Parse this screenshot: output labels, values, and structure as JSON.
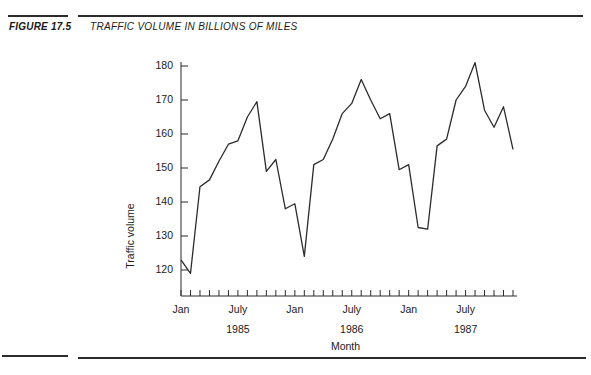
{
  "figure": {
    "label": "FIGURE 17.5",
    "title": "TRAFFIC VOLUME IN BILLIONS OF MILES"
  },
  "chart_data": {
    "type": "line",
    "title": "",
    "xlabel": "Month",
    "ylabel": "Traffic volume",
    "ylim": [
      118,
      184
    ],
    "yticks": [
      120,
      130,
      140,
      150,
      160,
      170,
      180
    ],
    "grid": false,
    "legend": false,
    "x_tick_count": 36,
    "x_tick_labels": [
      {
        "index": 0,
        "label": "Jan"
      },
      {
        "index": 6,
        "label": "July"
      },
      {
        "index": 12,
        "label": "Jan"
      },
      {
        "index": 18,
        "label": "July"
      },
      {
        "index": 24,
        "label": "Jan"
      },
      {
        "index": 30,
        "label": "July"
      }
    ],
    "year_labels": [
      {
        "index": 6,
        "label": "1985"
      },
      {
        "index": 18,
        "label": "1986"
      },
      {
        "index": 30,
        "label": "1987"
      }
    ],
    "x": [
      "Jan 1985",
      "Feb 1985",
      "Mar 1985",
      "Apr 1985",
      "May 1985",
      "Jun 1985",
      "Jul 1985",
      "Aug 1985",
      "Sep 1985",
      "Oct 1985",
      "Nov 1985",
      "Dec 1985",
      "Jan 1986",
      "Feb 1986",
      "Mar 1986",
      "Apr 1986",
      "May 1986",
      "Jun 1986",
      "Jul 1986",
      "Aug 1986",
      "Sep 1986",
      "Oct 1986",
      "Nov 1986",
      "Dec 1986",
      "Jan 1987",
      "Feb 1987",
      "Mar 1987",
      "Apr 1987",
      "May 1987",
      "Jun 1987",
      "Jul 1987",
      "Aug 1987",
      "Sep 1987",
      "Oct 1987",
      "Nov 1987",
      "Dec 1987"
    ],
    "series": [
      {
        "name": "Traffic volume",
        "color": "#2b2b2b",
        "values": [
          123,
          119,
          144.5,
          146.5,
          152,
          157,
          158,
          165,
          169.5,
          149,
          152.5,
          138,
          139.5,
          124,
          151,
          152.5,
          158.5,
          166,
          169,
          176,
          170,
          164.5,
          166,
          149.5,
          151,
          132.5,
          132,
          156.5,
          158.5,
          170,
          174,
          181,
          167,
          162,
          168,
          155.5
        ]
      }
    ]
  }
}
